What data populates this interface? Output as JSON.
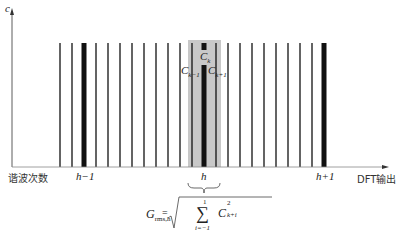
{
  "axes": {
    "y_label": "c",
    "x_label_left": "谐波次数",
    "x_label_right": "DFT输出"
  },
  "ticks": [
    {
      "label": "h−1",
      "x": 84
    },
    {
      "label": "h",
      "x": 204
    },
    {
      "label": "h+1",
      "x": 324
    }
  ],
  "bins": {
    "x_start": 60,
    "spacing": 12,
    "count": 23,
    "thick_indices": [
      2,
      12,
      22
    ],
    "highlight": {
      "x": 188,
      "width": 33,
      "color": "#c8c8c8"
    }
  },
  "annotations": {
    "ck": "C",
    "ck_sub": "k",
    "ckm1": "C",
    "ckm1_sub": "k−1",
    "ckp1": "C",
    "ckp1_sub": "k+1"
  },
  "formula": {
    "lhs": "G",
    "lhs_sub": "rms,h",
    "eq": "=",
    "sum_upper": "1",
    "sum_lower": "i=−1",
    "term": "C",
    "term_sup": "2",
    "term_sub": "k+i"
  }
}
